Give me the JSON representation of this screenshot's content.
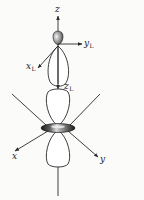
{
  "figure": {
    "colors": {
      "line": "#2a2a2a",
      "lobe_fill": "#ffffff",
      "dark_shade": "#3a3a3a",
      "background": "#fbfbfa"
    },
    "top_diagram": {
      "axes": {
        "z": {
          "label": "z",
          "subscript": ""
        },
        "y_local": {
          "label": "y",
          "subscript": "L"
        },
        "x_local": {
          "label": "x",
          "subscript": "L"
        },
        "z_local": {
          "label": "z",
          "subscript": "L"
        }
      }
    },
    "bottom_diagram": {
      "axes": {
        "x": {
          "label": "x",
          "subscript": ""
        },
        "y": {
          "label": "y",
          "subscript": ""
        }
      }
    }
  }
}
